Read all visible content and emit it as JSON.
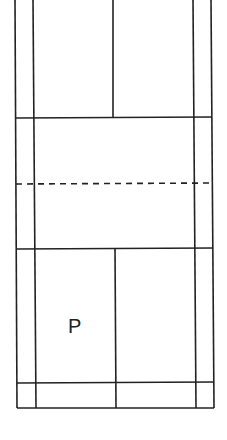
{
  "diagram": {
    "player_label": "P",
    "line_color": "#222222",
    "background": "#ffffff"
  }
}
